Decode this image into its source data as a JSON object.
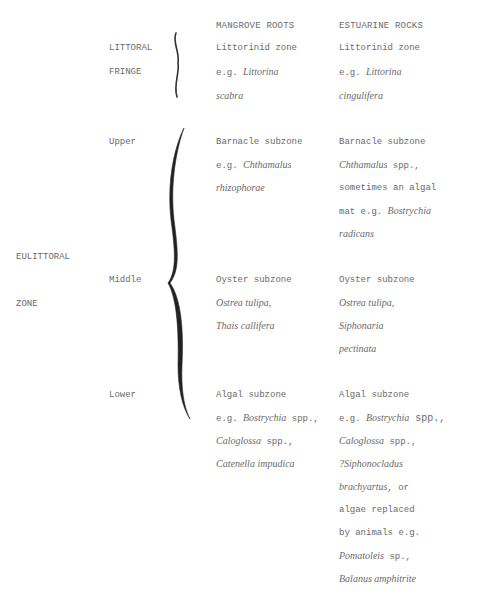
{
  "headers": {
    "col1": "MANGROVE ROOTS",
    "col2": "ESTUARINE ROCKS"
  },
  "zones": {
    "littoral_fringe": {
      "line1": "LITTORAL",
      "line2": "FRINGE"
    },
    "eulittoral": {
      "line1": "EULITTORAL",
      "line2": "ZONE"
    }
  },
  "subzones": {
    "upper": "Upper",
    "middle": "Middle",
    "lower": "Lower"
  },
  "fringe": {
    "mangrove": {
      "l1": "Littorinid zone",
      "l2a": "e.g. ",
      "l2b": "Littorina",
      "l3": "scabra"
    },
    "rocks": {
      "l1": "Littorinid zone",
      "l2a": "e.g. ",
      "l2b": "Littorina",
      "l3": "cingulifera"
    }
  },
  "upper": {
    "mangrove": {
      "l1": "Barnacle subzone",
      "l2a": "e.g. ",
      "l2b": "Chthamalus",
      "l3": "rhizophorae"
    },
    "rocks": {
      "l1": "Barnacle subzone",
      "l2a": "Chthamalus",
      "l2b": " spp.,",
      "l3": "sometimes an algal",
      "l4a": "mat e.g. ",
      "l4b": "Bostrychia",
      "l5": "radicans"
    }
  },
  "middle": {
    "mangrove": {
      "l1": "Oyster subzone",
      "l2": "Ostrea tulipa,",
      "l3": "Thais callifera"
    },
    "rocks": {
      "l1": "Oyster subzone",
      "l2": "Ostrea tulipa,",
      "l3": "Siphonaria",
      "l4": "pectinata"
    }
  },
  "lower": {
    "mangrove": {
      "l1": "Algal subzone",
      "l2a": "e.g. ",
      "l2b": "Bostrychia",
      "l2c": " spp.,",
      "l3a": "Caloglossa",
      "l3b": " spp.,",
      "l4": "Catenella impudica"
    },
    "rocks": {
      "l1": "Algal subzone",
      "l2a": "e.g. ",
      "l2b": "Bostrychia",
      "l2c": " spp.,",
      "l3a": "Caloglossa",
      "l3b": " spp.,",
      "l4": "?Siphonocladus",
      "l5a": "brachyartus",
      "l5b": ", or",
      "l6": "algae replaced",
      "l7": "by animals e.g.",
      "l8a": "Pomatoleis",
      "l8b": " sp.,",
      "l9": "Balanus amphitrite"
    }
  }
}
